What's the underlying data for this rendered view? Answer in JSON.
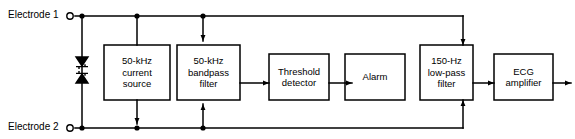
{
  "diagram": {
    "type": "schematic-block-diagram",
    "colors": {
      "line": "#000000",
      "background": "#ffffff",
      "text": "#000000"
    },
    "terminals": [
      {
        "name": "electrode-1",
        "label": "Electrode 1",
        "rail": "top"
      },
      {
        "name": "electrode-2",
        "label": "Electrode 2",
        "rail": "bottom"
      }
    ],
    "components": [
      {
        "name": "protection-diodes",
        "label": "",
        "type": "back-to-back-zener-diodes"
      }
    ],
    "blocks": [
      {
        "name": "current-source",
        "line1": "50-kHz",
        "line2": "current",
        "line3": "source"
      },
      {
        "name": "bandpass-filter",
        "line1": "50-kHz",
        "line2": "bandpass",
        "line3": "filter"
      },
      {
        "name": "threshold-detector",
        "line1": "Threshold",
        "line2": "detector",
        "line3": ""
      },
      {
        "name": "alarm",
        "line1": "Alarm",
        "line2": "",
        "line3": ""
      },
      {
        "name": "lowpass-filter",
        "line1": "150-Hz",
        "line2": "low-pass",
        "line3": "filter"
      },
      {
        "name": "ecg-amplifier",
        "line1": "ECG",
        "line2": "amplifier",
        "line3": ""
      }
    ]
  }
}
